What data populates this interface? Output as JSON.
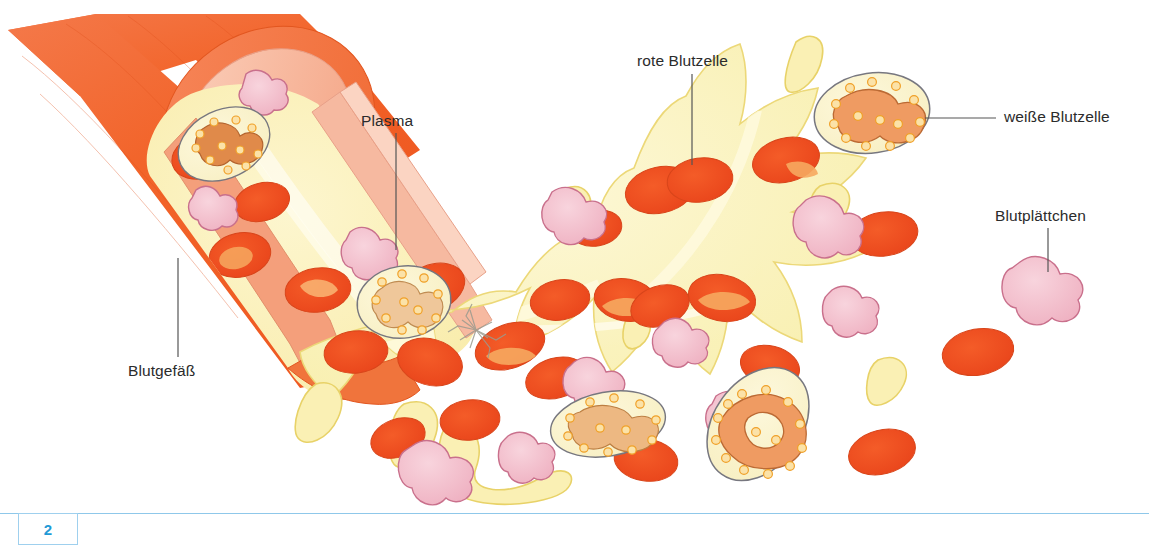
{
  "page": {
    "number": "2",
    "footer_rule_color": "#8fc8ea",
    "page_number_color": "#1f9ad6",
    "background": "#ffffff"
  },
  "illustration": {
    "subject": "Blut - Blutgefäß mit Blutzellen (schematische Zeichnung)",
    "style": "Buchillustration, Aquarell/Buntstift",
    "colors": {
      "vessel_wall": "#f2642a",
      "vessel_wall_dark": "#e8501c",
      "vessel_wall_light": "#f59a72",
      "vessel_inner_lining": "#f6b49a",
      "plasma": "#faf0b4",
      "plasma_outline": "#e8d268",
      "red_blood_cell": "#f04a1e",
      "red_blood_cell_center": "#f5a05c",
      "white_blood_cell_body": "#fbf3c8",
      "white_blood_cell_outline": "#77777f",
      "white_blood_cell_nucleus": "#ef9b62",
      "granule": "#f6a323",
      "platelet": "#f2bfcb",
      "platelet_outline": "#c9708c",
      "leader_line": "#555555",
      "label_text": "#2b2b2b"
    }
  },
  "labels": [
    {
      "id": "plasma",
      "text": "Plasma",
      "x": 361,
      "y": 120,
      "anchor": "left"
    },
    {
      "id": "rote-blutzelle",
      "text": "rote Blutzelle",
      "x": 637,
      "y": 60,
      "anchor": "left"
    },
    {
      "id": "weisse-blutzelle",
      "text": "weiße Blutzelle",
      "x": 1004,
      "y": 106,
      "anchor": "left"
    },
    {
      "id": "blutplaettchen",
      "text": "Blutplättchen",
      "x": 995,
      "y": 215,
      "anchor": "left"
    },
    {
      "id": "blutgefaess",
      "text": "Blutgefäß",
      "x": 128,
      "y": 370,
      "anchor": "left"
    }
  ],
  "leader_lines": [
    {
      "id": "plasma-leader",
      "from": [
        396,
        133
      ],
      "to": [
        396,
        250
      ]
    },
    {
      "id": "rote-blutzelle-leader",
      "from": [
        692,
        74
      ],
      "to": [
        692,
        165
      ]
    },
    {
      "id": "weisse-blutzelle-leader",
      "from": [
        996,
        118
      ],
      "to": [
        925,
        118
      ]
    },
    {
      "id": "blutplaettchen-leader",
      "from": [
        1048,
        228
      ],
      "to": [
        1048,
        272
      ]
    },
    {
      "id": "blutgefaess-leader",
      "from": [
        178,
        357
      ],
      "to": [
        178,
        258
      ]
    }
  ]
}
